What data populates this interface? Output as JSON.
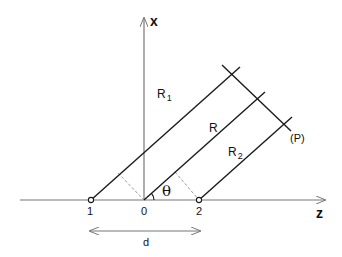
{
  "diagram": {
    "type": "two-source path difference geometry",
    "axes": {
      "x_label": "x",
      "z_label": "z"
    },
    "points": [
      {
        "id": "1",
        "label": "1",
        "z": -1
      },
      {
        "id": "0",
        "label": "0",
        "z": 0
      },
      {
        "id": "2",
        "label": "2",
        "z": 1
      }
    ],
    "rays": [
      {
        "id": "R1",
        "label": "R",
        "subscript": "1",
        "from": "1"
      },
      {
        "id": "R",
        "label": "R",
        "subscript": "",
        "from": "0"
      },
      {
        "id": "R2",
        "label": "R",
        "subscript": "2",
        "from": "2"
      }
    ],
    "wavefront_label": "(P)",
    "angle_label": "θ",
    "separation_label": "d",
    "colors": {
      "line": "#1a1a1a",
      "axis": "#777777",
      "dashed": "#999999",
      "background": "#ffffff"
    }
  }
}
